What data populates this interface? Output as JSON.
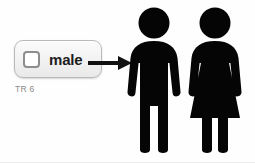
{
  "scene": {
    "background_color": "#fefefe",
    "figure_color": "#050505"
  },
  "checkbox_widget": {
    "name": "male-checkbox",
    "label": "male",
    "checked": false,
    "box_border_color": "#8e8e8e",
    "panel_background": "#f3f3f3",
    "panel_border_color": "#b9b9b9"
  },
  "caption": {
    "text": "TR 6",
    "color": "#8a8a8a"
  },
  "arrow": {
    "name": "pointer-arrow",
    "direction": "right",
    "color": "#111111",
    "points_to": "male-figure"
  },
  "figures": [
    {
      "name": "male-figure",
      "gender": "male",
      "icon": "person-man-icon",
      "color": "#050505"
    },
    {
      "name": "female-figure",
      "gender": "female",
      "icon": "person-woman-icon",
      "color": "#050505"
    }
  ]
}
